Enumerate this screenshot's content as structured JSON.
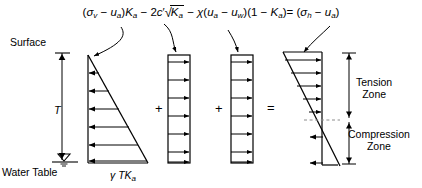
{
  "figure": {
    "type": "engineering-diagram",
    "equation": {
      "full_text": "(σv − ua)Ka − 2c′√Ka − χ(ua − uw)(1 − Ka) = (σh − ua)",
      "term1_open": "(",
      "term1_sigma": "σ",
      "term1_sigma_sub": "v",
      "term1_minus": " − ",
      "term1_u": "u",
      "term1_u_sub": "a",
      "term1_close": ")",
      "term1_K": "K",
      "term1_K_sub": "a",
      "op_minus_1": " − ",
      "term2_coef": "2",
      "term2_c": "c",
      "term2_prime": "′",
      "term2_radsign": "√",
      "term2_K": "K",
      "term2_K_sub": "a",
      "op_minus_2": " − ",
      "term3_chi": "χ",
      "term3_open": "(",
      "term3_u1": "u",
      "term3_u1_sub": "a",
      "term3_minus": " − ",
      "term3_u2": "u",
      "term3_u2_sub": "w",
      "term3_close": ")(1 − ",
      "term3_K": "K",
      "term3_K_sub": "a",
      "term3_close2": ")",
      "equals": "= ",
      "rhs_open": "(",
      "rhs_sigma": "σ",
      "rhs_sigma_sub": "h",
      "rhs_minus": " − ",
      "rhs_u": "u",
      "rhs_u_sub": "a",
      "rhs_close": ")"
    },
    "labels": {
      "surface": "Surface",
      "water_table": "Water Table",
      "depth_T": "T",
      "pressure_gamma_TKa_gamma": "γ",
      "pressure_gamma_TKa_T": "T",
      "pressure_gamma_TKa_K": "K",
      "pressure_gamma_TKa_sub": "a",
      "tension_zone_line1": "Tension",
      "tension_zone_line2": "Zone",
      "compression_zone_line1": "Compression",
      "compression_zone_line2": "Zone",
      "operator_plus_1": "+",
      "operator_plus_2": "+",
      "operator_equals": "="
    },
    "diagrams": [
      {
        "id": "diagram-1-overburden",
        "shape": "triangle",
        "arrow_direction": "left",
        "arrow_count": 6,
        "caption": "γTKa",
        "description": "Triangular active pressure increasing with depth"
      },
      {
        "id": "diagram-2-cohesion",
        "shape": "rectangle",
        "arrow_direction": "right",
        "arrow_count": 6,
        "description": "Uniform cohesion term 2c′√Ka"
      },
      {
        "id": "diagram-3-suction",
        "shape": "rectangle",
        "arrow_direction": "right",
        "arrow_count": 6,
        "description": "Uniform matric suction term χ(ua − uw)(1 − Ka)"
      },
      {
        "id": "diagram-4-result",
        "shape": "crossing-diagonal",
        "arrow_direction_upper": "right",
        "arrow_direction_lower": "left",
        "upper_arrow_count": 5,
        "lower_arrow_count": 2,
        "description": "Resultant net lateral pressure with tension zone above and compression zone below"
      }
    ],
    "colors": {
      "stroke": "#000000",
      "background": "#ffffff",
      "dashed_guide": "#999999"
    }
  }
}
